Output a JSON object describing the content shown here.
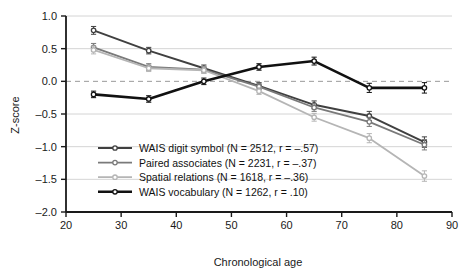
{
  "chart_data": {
    "type": "line",
    "title": "",
    "xlabel": "Chronological age",
    "ylabel": "Z-score",
    "xlim": [
      20,
      90
    ],
    "ylim": [
      -2.0,
      1.0
    ],
    "xticks": [
      "20",
      "30",
      "40",
      "50",
      "60",
      "70",
      "80",
      "90"
    ],
    "xtick_values": [
      20,
      30,
      40,
      50,
      60,
      70,
      80,
      90
    ],
    "yticks": [
      "1.0",
      "0.5",
      "0.0",
      "-0.5",
      "-1.0",
      "-1.5",
      "-2.0"
    ],
    "ytick_values": [
      1.0,
      0.5,
      0.0,
      -0.5,
      -1.0,
      -1.5,
      -2.0
    ],
    "grid": true,
    "zero_reference_line": 0.0,
    "legend_position": "lower-left-inside",
    "x": [
      25,
      35,
      45,
      55,
      65,
      75,
      85
    ],
    "series": [
      {
        "name": "WAIS digit symbol",
        "label": "WAIS digit symbol (N = 2512, r = -.57)",
        "n": 2512,
        "r": -0.57,
        "color": "#404040",
        "line_width": 2.0,
        "values": [
          0.78,
          0.47,
          0.2,
          -0.07,
          -0.36,
          -0.53,
          -0.93
        ],
        "errors": [
          0.06,
          0.05,
          0.05,
          0.05,
          0.06,
          0.07,
          0.08
        ]
      },
      {
        "name": "Paired associates",
        "label": "Paired associates (N = 2231, r = -.37)",
        "n": 2231,
        "r": -0.37,
        "color": "#7a7a7a",
        "line_width": 1.8,
        "values": [
          0.52,
          0.22,
          0.18,
          -0.08,
          -0.4,
          -0.62,
          -0.97
        ],
        "errors": [
          0.06,
          0.05,
          0.05,
          0.05,
          0.06,
          0.07,
          0.08
        ]
      },
      {
        "name": "Spatial relations",
        "label": "Spatial relations (N = 1618, r = -.36)",
        "n": 1618,
        "r": -0.36,
        "color": "#b5b5b5",
        "line_width": 1.8,
        "values": [
          0.48,
          0.2,
          0.17,
          -0.15,
          -0.55,
          -0.87,
          -1.45
        ],
        "errors": [
          0.06,
          0.05,
          0.05,
          0.05,
          0.06,
          0.07,
          0.08
        ]
      },
      {
        "name": "WAIS vocabulary",
        "label": "WAIS vocabulary (N = 1262, r = .10)",
        "n": 1262,
        "r": 0.1,
        "color": "#111111",
        "line_width": 2.6,
        "values": [
          -0.2,
          -0.27,
          0.0,
          0.22,
          0.31,
          -0.1,
          -0.1
        ],
        "errors": [
          0.05,
          0.05,
          0.05,
          0.05,
          0.06,
          0.07,
          0.08
        ]
      }
    ]
  },
  "axes": {
    "x_title": "Chronological age",
    "y_title": "Z-score"
  },
  "colors": {
    "background": "#ffffff",
    "axis": "#1a1a1a",
    "grid": "#c9c9c9",
    "zero_line": "#999999",
    "text": "#111111"
  }
}
